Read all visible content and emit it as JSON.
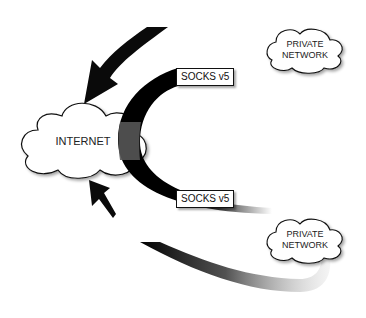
{
  "diagram": {
    "type": "network-topology",
    "nodes": {
      "internet": {
        "label": "INTERNET"
      },
      "private_network_top": {
        "line1": "PRIVATE",
        "line2": "NETWORK"
      },
      "private_network_bottom": {
        "line1": "PRIVATE",
        "line2": "NETWORK"
      }
    },
    "connections": {
      "top_tunnel": {
        "label": "SOCKS v5"
      },
      "bottom_tunnel": {
        "label": "SOCKS v5"
      }
    },
    "colors": {
      "arrow": "#0a0a0a",
      "tunnel_overlap": "#555555",
      "cloud_fill": "#ffffff",
      "cloud_stroke": "#111111"
    }
  }
}
